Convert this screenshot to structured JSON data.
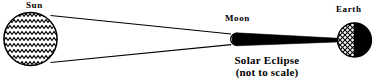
{
  "diagram": {
    "title": "Solar Eclipse",
    "subtitle": "(not to scale)",
    "type": "astronomical-schematic",
    "colors": {
      "ink": "#000000",
      "background": "#ffffff"
    },
    "bodies": [
      {
        "key": "sun",
        "label": "Sun",
        "fill_pattern": "zigzag-wave-hatch",
        "cx": 30.5,
        "cy": 39,
        "r": 27.5
      },
      {
        "key": "moon",
        "label": "Moon",
        "fill_pattern": "half-lit-white-left-black-right",
        "cx": 236.5,
        "cy": 39,
        "r": 6
      },
      {
        "key": "earth",
        "label": "Earth",
        "fill_pattern": "crosshatch-left-black-right",
        "cx": 354.5,
        "cy": 40,
        "r": 17
      }
    ],
    "shadow": {
      "key": "umbra",
      "name": "umbra-cone",
      "description": "black tapering shadow cone from Moon to Earth"
    },
    "rays": {
      "key": "tangent-rays",
      "name": "sunlight-tangent-lines",
      "count": 2
    }
  }
}
